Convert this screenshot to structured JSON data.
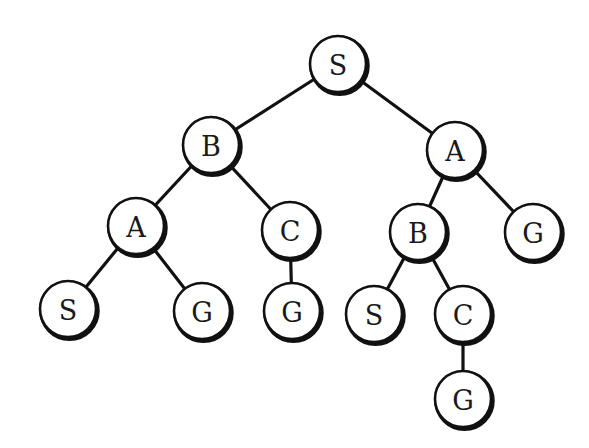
{
  "diagram": {
    "type": "search-tree",
    "nodes": [
      {
        "id": "n0",
        "label": "S",
        "x": 338,
        "y": 64,
        "r": 28
      },
      {
        "id": "n1",
        "label": "B",
        "x": 211,
        "y": 145,
        "r": 28
      },
      {
        "id": "n2",
        "label": "A",
        "x": 455,
        "y": 150,
        "r": 28
      },
      {
        "id": "n3",
        "label": "A",
        "x": 136,
        "y": 226,
        "r": 28
      },
      {
        "id": "n4",
        "label": "C",
        "x": 290,
        "y": 230,
        "r": 28
      },
      {
        "id": "n5",
        "label": "B",
        "x": 418,
        "y": 232,
        "r": 28
      },
      {
        "id": "n6",
        "label": "G",
        "x": 533,
        "y": 232,
        "r": 28
      },
      {
        "id": "n7",
        "label": "S",
        "x": 68,
        "y": 309,
        "r": 28
      },
      {
        "id": "n8",
        "label": "G",
        "x": 202,
        "y": 311,
        "r": 28
      },
      {
        "id": "n9",
        "label": "G",
        "x": 292,
        "y": 311,
        "r": 28
      },
      {
        "id": "n10",
        "label": "S",
        "x": 374,
        "y": 314,
        "r": 28
      },
      {
        "id": "n11",
        "label": "C",
        "x": 463,
        "y": 314,
        "r": 28
      },
      {
        "id": "n12",
        "label": "G",
        "x": 463,
        "y": 399,
        "r": 28
      }
    ],
    "edges": [
      {
        "from": "n0",
        "to": "n1"
      },
      {
        "from": "n0",
        "to": "n2"
      },
      {
        "from": "n1",
        "to": "n3"
      },
      {
        "from": "n1",
        "to": "n4"
      },
      {
        "from": "n2",
        "to": "n5"
      },
      {
        "from": "n2",
        "to": "n6"
      },
      {
        "from": "n3",
        "to": "n7"
      },
      {
        "from": "n3",
        "to": "n8"
      },
      {
        "from": "n4",
        "to": "n9"
      },
      {
        "from": "n5",
        "to": "n10"
      },
      {
        "from": "n5",
        "to": "n11"
      },
      {
        "from": "n11",
        "to": "n12"
      }
    ],
    "colors": {
      "stroke": "#111111",
      "fill": "#ffffff",
      "text": "#1a1a1a",
      "background": "#ffffff"
    }
  }
}
